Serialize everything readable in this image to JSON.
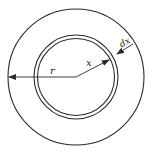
{
  "diagram": {
    "stroke_color": "#2a2a2a",
    "background": "#ffffff",
    "labels": {
      "r": "r",
      "x": "x",
      "dx": "dx"
    },
    "geometry": {
      "center": [
        76,
        77
      ],
      "outer_radius": 68,
      "ring_outer_radius": 42,
      "ring_inner_radius": 38.5
    }
  }
}
